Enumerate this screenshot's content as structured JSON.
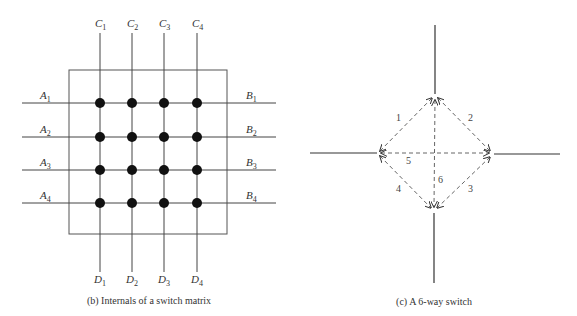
{
  "matrix": {
    "caption": "(b) Internals of a switch matrix",
    "top_labels": [
      {
        "l": "C",
        "s": "1"
      },
      {
        "l": "C",
        "s": "2"
      },
      {
        "l": "C",
        "s": "3"
      },
      {
        "l": "C",
        "s": "4"
      }
    ],
    "bottom_labels": [
      {
        "l": "D",
        "s": "1"
      },
      {
        "l": "D",
        "s": "2"
      },
      {
        "l": "D",
        "s": "3"
      },
      {
        "l": "D",
        "s": "4"
      }
    ],
    "left_labels": [
      {
        "l": "A",
        "s": "1"
      },
      {
        "l": "A",
        "s": "2"
      },
      {
        "l": "A",
        "s": "3"
      },
      {
        "l": "A",
        "s": "4"
      }
    ],
    "right_labels": [
      {
        "l": "B",
        "s": "1"
      },
      {
        "l": "B",
        "s": "2"
      },
      {
        "l": "B",
        "s": "3"
      },
      {
        "l": "B",
        "s": "4"
      }
    ],
    "grid_size": "4x4"
  },
  "switch": {
    "caption": "(c) A 6-way switch",
    "connections": [
      {
        "id": "1",
        "label": "1",
        "from": "left",
        "to": "top"
      },
      {
        "id": "2",
        "label": "2",
        "from": "top",
        "to": "right"
      },
      {
        "id": "3",
        "label": "3",
        "from": "right",
        "to": "bottom"
      },
      {
        "id": "4",
        "label": "4",
        "from": "left",
        "to": "bottom"
      },
      {
        "id": "5",
        "label": "5",
        "from": "left",
        "to": "right"
      },
      {
        "id": "6",
        "label": "6",
        "from": "top",
        "to": "bottom"
      }
    ]
  }
}
